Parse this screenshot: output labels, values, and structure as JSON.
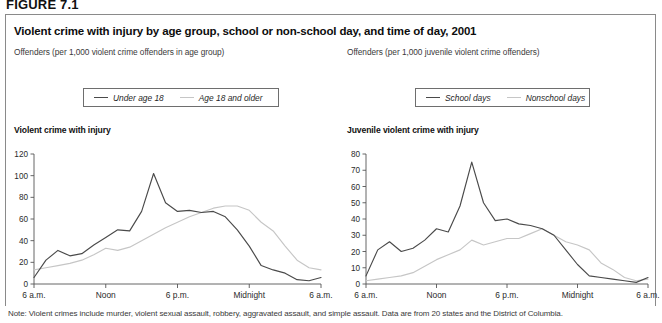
{
  "figure": {
    "number": "FIGURE 7.1",
    "title": "Violent crime with injury by age group, school or non-school day, and time of day, 2001",
    "note": "Note: Violent crimes include murder, violent sexual assault, robbery, aggravated assault, and simple assault. Data are from 20 states and the District of Columbia."
  },
  "left_panel": {
    "subtitle": "Offenders (per 1,000 violent crime offenders in age group)",
    "chart_heading": "Violent crime with injury",
    "legend": [
      {
        "label": "Under age 18",
        "color": "#4a4a4a"
      },
      {
        "label": "Age 18 and older",
        "color": "#c6c6c6"
      }
    ]
  },
  "right_panel": {
    "subtitle": "Offenders (per 1,000 juvenile violent crime offenders)",
    "chart_heading": "Juvenile violent crime with injury",
    "legend": [
      {
        "label": "School days",
        "color": "#4a4a4a"
      },
      {
        "label": "Nonschool days",
        "color": "#c6c6c6"
      }
    ]
  },
  "chart_data": [
    {
      "id": "left",
      "type": "line",
      "title": "Violent crime with injury",
      "subtitle": "Offenders (per 1,000 violent crime offenders in age group)",
      "xlabel": "",
      "ylabel": "",
      "ylim": [
        0,
        120
      ],
      "yticks": [
        0,
        20,
        40,
        60,
        80,
        100,
        120
      ],
      "grid": false,
      "legend_position": "top",
      "x": [
        0,
        1,
        2,
        3,
        4,
        5,
        6,
        7,
        8,
        9,
        10,
        11,
        12,
        13,
        14,
        15,
        16,
        17,
        18,
        19,
        20,
        21,
        22,
        23,
        24
      ],
      "xtick_positions": [
        0,
        6,
        12,
        18,
        24
      ],
      "xtick_labels": [
        "6 a.m.",
        "Noon",
        "6 p.m.",
        "Midnight",
        "6 a.m."
      ],
      "series": [
        {
          "name": "Under age 18",
          "color": "#4a4a4a",
          "values": [
            6,
            22,
            31,
            26,
            28,
            36,
            43,
            50,
            49,
            67,
            102,
            75,
            67,
            68,
            66,
            67,
            62,
            50,
            35,
            17,
            13,
            10,
            4,
            3,
            6
          ]
        },
        {
          "name": "Age 18 and older",
          "color": "#c6c6c6",
          "values": [
            13,
            15,
            17,
            19,
            22,
            27,
            33,
            31,
            34,
            40,
            46,
            52,
            57,
            62,
            66,
            70,
            72,
            72,
            68,
            57,
            49,
            35,
            22,
            15,
            13
          ]
        }
      ]
    },
    {
      "id": "right",
      "type": "line",
      "title": "Juvenile violent crime with injury",
      "subtitle": "Offenders (per 1,000 juvenile violent crime offenders)",
      "xlabel": "",
      "ylabel": "",
      "ylim": [
        0,
        80
      ],
      "yticks": [
        0,
        10,
        20,
        30,
        40,
        50,
        60,
        70,
        80
      ],
      "grid": false,
      "legend_position": "top",
      "x": [
        0,
        1,
        2,
        3,
        4,
        5,
        6,
        7,
        8,
        9,
        10,
        11,
        12,
        13,
        14,
        15,
        16,
        17,
        18,
        19,
        20,
        21,
        22,
        23,
        24
      ],
      "xtick_positions": [
        0,
        6,
        12,
        18,
        24
      ],
      "xtick_labels": [
        "6 a.m.",
        "Noon",
        "6 p.m.",
        "Midnight",
        "6 a.m."
      ],
      "series": [
        {
          "name": "School days",
          "color": "#4a4a4a",
          "values": [
            5,
            21,
            26,
            20,
            22,
            27,
            34,
            32,
            48,
            75,
            50,
            39,
            40,
            37,
            36,
            34,
            30,
            21,
            12,
            5,
            4,
            3,
            2,
            1,
            4
          ]
        },
        {
          "name": "Nonschool days",
          "color": "#c6c6c6",
          "values": [
            2,
            3,
            4,
            5,
            7,
            11,
            15,
            18,
            21,
            27,
            24,
            26,
            28,
            28,
            31,
            34,
            30,
            26,
            24,
            21,
            13,
            9,
            4,
            2,
            3
          ]
        }
      ]
    }
  ]
}
